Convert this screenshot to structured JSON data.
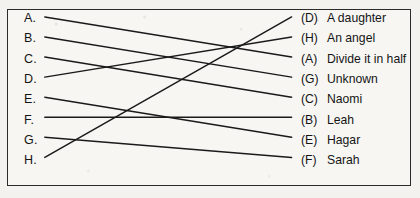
{
  "diagram": {
    "type": "matching-exercise",
    "title": "",
    "left_column": [
      {
        "id": "A",
        "label": "A."
      },
      {
        "id": "B",
        "label": "B."
      },
      {
        "id": "C",
        "label": "C."
      },
      {
        "id": "D",
        "label": "D."
      },
      {
        "id": "E",
        "label": "E."
      },
      {
        "id": "F",
        "label": "F."
      },
      {
        "id": "G",
        "label": "G."
      },
      {
        "id": "H",
        "label": "H."
      }
    ],
    "right_column": [
      {
        "key": "(D)",
        "text": "A daughter"
      },
      {
        "key": "(H)",
        "text": "An angel"
      },
      {
        "key": "(A)",
        "text": "Divide it in half"
      },
      {
        "key": "(G)",
        "text": "Unknown"
      },
      {
        "key": "(C)",
        "text": "Naomi"
      },
      {
        "key": "(B)",
        "text": "Leah"
      },
      {
        "key": "(E)",
        "text": "Hagar"
      },
      {
        "key": "(F)",
        "text": "Sarah"
      }
    ],
    "connections": [
      {
        "from": "A",
        "to_index": 2,
        "to_key": "(A)"
      },
      {
        "from": "B",
        "to_index": 3,
        "to_key": "(G)"
      },
      {
        "from": "C",
        "to_index": 4,
        "to_key": "(C)"
      },
      {
        "from": "D",
        "to_index": 1,
        "to_key": "(H)"
      },
      {
        "from": "E",
        "to_index": 6,
        "to_key": "(E)"
      },
      {
        "from": "F",
        "to_index": 5,
        "to_key": "(B)"
      },
      {
        "from": "G",
        "to_index": 7,
        "to_key": "(F)"
      },
      {
        "from": "H",
        "to_index": 0,
        "to_key": "(D)"
      }
    ],
    "line_color": "#1a1a1a",
    "border_color": "#2b2b2b",
    "background_color": "#f7f6f3"
  }
}
